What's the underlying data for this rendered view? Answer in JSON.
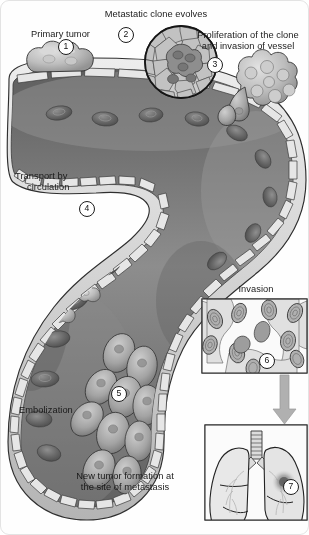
{
  "figure": {
    "colors": {
      "background": "#fefefe",
      "vessel_lumen_dark": "#6f6f6f",
      "vessel_lumen_mid": "#8a8a8a",
      "vessel_wall": "#d8d8d8",
      "outline": "#2b2b2b",
      "tumor_cell": "#b9b9b9",
      "rbc": "#5c5c5c",
      "panel_fill": "#f2f2f2",
      "arrow": "#a9a9a9",
      "label_text": "#1a1a1a"
    }
  },
  "labels": {
    "metastatic_clone": "Metastatic clone evolves",
    "primary_tumor": "Primary tumor",
    "proliferation_line1": "Proliferation of the clone",
    "proliferation_line2": "and invasion of vessel",
    "transport_line1": "Transport by",
    "transport_line2": "circulation",
    "embolization": "Embolization",
    "invasion": "Invasion",
    "new_tumor_line1": "New tumor formation at",
    "new_tumor_line2": "the site of metastasis"
  },
  "callouts": [
    {
      "id": "1",
      "number": "1",
      "refers_to": "primary tumor at vessel surface"
    },
    {
      "id": "2",
      "number": "2",
      "refers_to": "metastatic clone evolving within tissue"
    },
    {
      "id": "3",
      "number": "3",
      "refers_to": "clone proliferation and vessel invasion"
    },
    {
      "id": "4",
      "number": "4",
      "refers_to": "tumor cells transported in circulation"
    },
    {
      "id": "5",
      "number": "5",
      "refers_to": "tumor cell embolus lodged in vessel"
    },
    {
      "id": "6",
      "number": "6",
      "refers_to": "tumor cells invading tissue"
    },
    {
      "id": "7",
      "number": "7",
      "refers_to": "new tumor in lung"
    }
  ],
  "panels": {
    "invasion": {
      "caption": "Invasion",
      "callout": "6"
    },
    "lungs": {
      "callout": "7",
      "caption_line1": "New tumor formation at",
      "caption_line2": "the site of metastasis"
    }
  },
  "icons": {
    "arrow_down": "down-arrow-icon",
    "circle_inset": "magnified-tissue-inset"
  }
}
